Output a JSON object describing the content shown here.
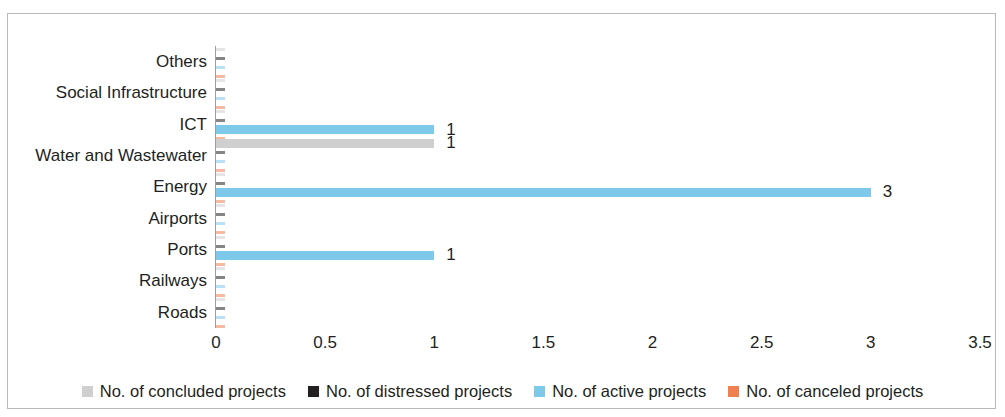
{
  "chart_data": {
    "type": "bar",
    "orientation": "horizontal",
    "title": "",
    "xlabel": "",
    "ylabel": "",
    "xlim": [
      0,
      3.5
    ],
    "xticks": [
      "0",
      "0.5",
      "1",
      "1.5",
      "2",
      "2.5",
      "3",
      "3.5"
    ],
    "xtick_values": [
      0,
      0.5,
      1,
      1.5,
      2,
      2.5,
      3,
      3.5
    ],
    "grid": false,
    "legend_position": "bottom",
    "categories": [
      "Others",
      "Social Infrastructure",
      "ICT",
      "Water and Wastewater",
      "Energy",
      "Airports",
      "Ports",
      "Railways",
      "Roads"
    ],
    "series": [
      {
        "name": "No. of concluded projects",
        "color": "#cfcfcf",
        "values": [
          0,
          0,
          0,
          1,
          0,
          0,
          0,
          0,
          0
        ],
        "labels": [
          "",
          "",
          "",
          "1",
          "",
          "",
          "",
          "",
          ""
        ]
      },
      {
        "name": "No. of distressed projects",
        "color": "#231f20",
        "values": [
          0,
          0,
          0,
          0,
          0,
          0,
          0,
          0,
          0
        ],
        "labels": [
          "",
          "",
          "",
          "",
          "",
          "",
          "",
          "",
          ""
        ]
      },
      {
        "name": "No. of active projects",
        "color": "#7ec8ea",
        "values": [
          0,
          0,
          1,
          0,
          3,
          0,
          1,
          0,
          0
        ],
        "labels": [
          "",
          "",
          "1",
          "",
          "3",
          "",
          "1",
          "",
          ""
        ]
      },
      {
        "name": "No. of canceled projects",
        "color": "#f07f52",
        "values": [
          0,
          0,
          0,
          0,
          0,
          0,
          0,
          0,
          0
        ],
        "labels": [
          "",
          "",
          "",
          "",
          "",
          "",
          "",
          "",
          ""
        ]
      }
    ]
  },
  "axis": {
    "ticks": [
      {
        "label": "0",
        "value": 0
      },
      {
        "label": "0.5",
        "value": 0.5
      },
      {
        "label": "1",
        "value": 1
      },
      {
        "label": "1.5",
        "value": 1.5
      },
      {
        "label": "2",
        "value": 2
      },
      {
        "label": "2.5",
        "value": 2.5
      },
      {
        "label": "3",
        "value": 3
      },
      {
        "label": "3.5",
        "value": 3.5
      }
    ]
  },
  "legend": {
    "items": [
      {
        "label": "No. of concluded projects",
        "color": "#cfcfcf"
      },
      {
        "label": "No. of distressed projects",
        "color": "#231f20"
      },
      {
        "label": "No. of active projects",
        "color": "#7ec8ea"
      },
      {
        "label": "No. of canceled projects",
        "color": "#f07f52"
      }
    ]
  }
}
